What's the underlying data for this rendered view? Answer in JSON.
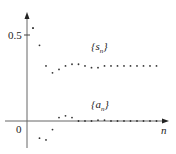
{
  "chart_data": {
    "type": "scatter",
    "title": "",
    "xlabel": "n",
    "ylabel": "",
    "ylim": [
      -0.16,
      0.62
    ],
    "y_ticks": [
      {
        "value": 0,
        "label": "0"
      },
      {
        "value": 0.5,
        "label": "0.5"
      }
    ],
    "grid": false,
    "x": [
      1,
      2,
      3,
      4,
      5,
      6,
      7,
      8,
      9,
      10,
      11,
      12,
      13,
      14,
      15,
      16,
      17,
      18,
      19,
      20
    ],
    "series": [
      {
        "name": "{s_n}",
        "label_main": "{s",
        "label_sub": "n",
        "label_close": "}",
        "values": [
          0.54,
          0.44,
          0.32,
          0.28,
          0.3,
          0.32,
          0.33,
          0.33,
          0.32,
          0.31,
          0.31,
          0.32,
          0.32,
          0.32,
          0.32,
          0.32,
          0.32,
          0.32,
          0.32,
          0.32
        ]
      },
      {
        "name": "{a_n}",
        "label_main": "{a",
        "label_sub": "n",
        "label_close": "}",
        "values": [
          0.54,
          -0.1,
          -0.11,
          -0.05,
          0.02,
          0.03,
          0.02,
          0.0,
          0.0,
          0.0,
          0.005,
          0.005,
          0.0,
          0.0,
          0.0,
          0.0,
          0.0,
          0.0,
          0.0,
          0.0
        ]
      }
    ]
  },
  "labels": {
    "y_half": "0.5",
    "origin": "0",
    "x_axis": "n"
  }
}
